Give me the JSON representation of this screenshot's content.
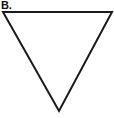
{
  "figure": {
    "background_color": "#ffffff",
    "width": 114,
    "height": 118,
    "panel_label": "B.",
    "label_color": "#111111"
  },
  "shape": {
    "name": "inverted-triangle",
    "description": "downward pointing triangle outline",
    "filled": false,
    "fill_color": "#ffffff",
    "stroke_color": "#1a1a1a",
    "stroke_width": 2,
    "points": "3,12 112,12 59,111",
    "vertices": [
      {
        "name": "top-left",
        "x": 3,
        "y": 12
      },
      {
        "name": "top-right",
        "x": 112,
        "y": 12
      },
      {
        "name": "bottom-apex",
        "x": 59,
        "y": 111
      }
    ]
  }
}
